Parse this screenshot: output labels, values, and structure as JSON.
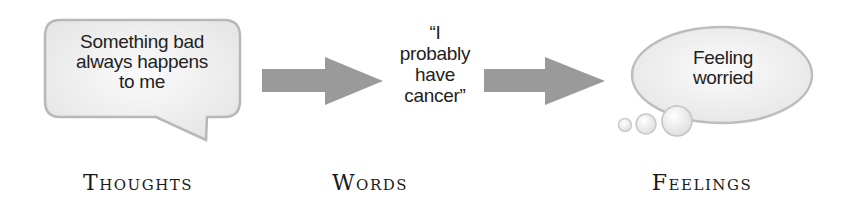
{
  "diagram": {
    "type": "flow",
    "steps": [
      {
        "label": "Thoughts",
        "shape": "speech-bubble",
        "text_lines": [
          "Something bad",
          "always happens",
          "to me"
        ]
      },
      {
        "label": "Words",
        "shape": "plain-text",
        "text_lines": [
          "“I",
          "probably",
          "have",
          "cancer”"
        ]
      },
      {
        "label": "Feelings",
        "shape": "thought-bubble",
        "text_lines": [
          "Feeling",
          "worried"
        ]
      }
    ],
    "connectors": [
      {
        "from": "Thoughts",
        "to": "Words",
        "shape": "block-arrow"
      },
      {
        "from": "Words",
        "to": "Feelings",
        "shape": "block-arrow"
      }
    ]
  },
  "colors": {
    "background": "#ffffff",
    "arrow_fill": "#9a9a9a",
    "bubble_fill": "#f2f2f2",
    "bubble_stroke": "#b5b5b5",
    "text": "#222222"
  }
}
